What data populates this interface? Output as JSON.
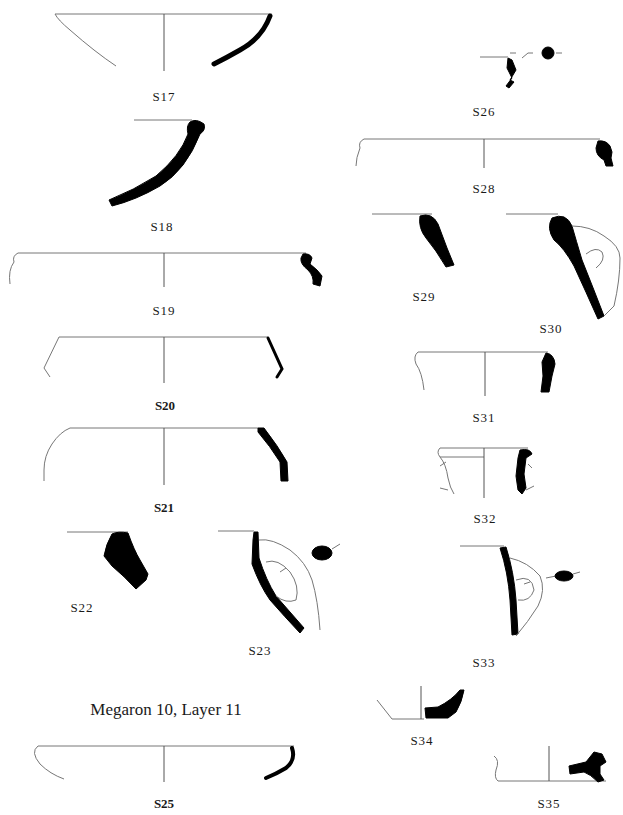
{
  "figure": {
    "section_caption": "Megaron 10, Layer 11",
    "vessels": [
      {
        "id": "S17",
        "label": "S17",
        "style": "regular"
      },
      {
        "id": "S18",
        "label": "S18",
        "style": "regular"
      },
      {
        "id": "S19",
        "label": "S19",
        "style": "regular"
      },
      {
        "id": "S20",
        "label": "S20",
        "style": "bold"
      },
      {
        "id": "S21",
        "label": "S21",
        "style": "bold"
      },
      {
        "id": "S22",
        "label": "S22",
        "style": "regular"
      },
      {
        "id": "S23",
        "label": "S23",
        "style": "regular"
      },
      {
        "id": "S25",
        "label": "S25",
        "style": "bold"
      },
      {
        "id": "S26",
        "label": "S26",
        "style": "regular"
      },
      {
        "id": "S28",
        "label": "S28",
        "style": "regular"
      },
      {
        "id": "S29",
        "label": "S29",
        "style": "regular"
      },
      {
        "id": "S30",
        "label": "S30",
        "style": "regular"
      },
      {
        "id": "S31",
        "label": "S31",
        "style": "regular"
      },
      {
        "id": "S32",
        "label": "S32",
        "style": "regular"
      },
      {
        "id": "S33",
        "label": "S33",
        "style": "regular"
      },
      {
        "id": "S34",
        "label": "S34",
        "style": "regular"
      },
      {
        "id": "S35",
        "label": "S35",
        "style": "regular"
      }
    ]
  }
}
